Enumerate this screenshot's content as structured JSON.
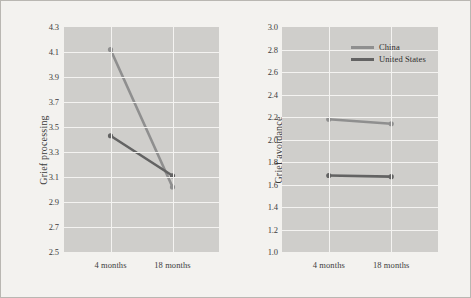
{
  "figure": {
    "background_color": "#f3f2ef",
    "plot_background_color": "#cfcecb",
    "gridline_color": "#f4f3f1",
    "border_color": "#b9b7b2"
  },
  "legend": {
    "position": "top-right-of-right-panel",
    "entries": [
      {
        "label": "China",
        "color": "#8f8f8f"
      },
      {
        "label": "United States",
        "color": "#636363"
      }
    ]
  },
  "chart_data": [
    {
      "type": "line",
      "panel": "left",
      "title": "",
      "xlabel": "",
      "ylabel": "Grief processing",
      "categories": [
        "4 months",
        "18 months"
      ],
      "ylim": [
        2.5,
        4.3
      ],
      "yticks": [
        "4.3",
        "4.1",
        "3.9",
        "3.7",
        "3.5",
        "3.3",
        "3.1",
        "2.9",
        "2.7",
        "2.5"
      ],
      "ytick_values": [
        4.3,
        4.1,
        3.9,
        3.7,
        3.5,
        3.3,
        3.1,
        2.9,
        2.7,
        2.5
      ],
      "grid": true,
      "series": [
        {
          "name": "China",
          "color": "#8f8f8f",
          "values": [
            4.12,
            3.02
          ]
        },
        {
          "name": "United States",
          "color": "#636363",
          "values": [
            3.43,
            3.11
          ]
        }
      ]
    },
    {
      "type": "line",
      "panel": "right",
      "title": "",
      "xlabel": "",
      "ylabel": "Grief avoidance",
      "categories": [
        "4 months",
        "18 months"
      ],
      "ylim": [
        1.0,
        3.0
      ],
      "yticks": [
        "3.0",
        "2.8",
        "2.6",
        "2.4",
        "2.2",
        "2.0",
        "1.8",
        "1.6",
        "1.4",
        "1.2",
        "1.0"
      ],
      "ytick_values": [
        3.0,
        2.8,
        2.6,
        2.4,
        2.2,
        2.0,
        1.8,
        1.6,
        1.4,
        1.2,
        1.0
      ],
      "grid": true,
      "series": [
        {
          "name": "China",
          "color": "#8f8f8f",
          "values": [
            2.18,
            2.14
          ]
        },
        {
          "name": "United States",
          "color": "#636363",
          "values": [
            1.68,
            1.67
          ]
        }
      ]
    }
  ]
}
